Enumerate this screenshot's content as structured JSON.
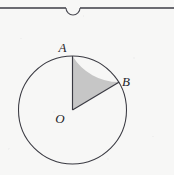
{
  "figure": {
    "background_color": "#f7f7f6",
    "stroke_color": "#3a3a42",
    "sector_fill_color": "#c6c6c6",
    "labels": {
      "center": "O",
      "top_point": "A",
      "arc_point": "B"
    },
    "geometry": {
      "center_x": 72.5,
      "center_y": 110,
      "radius": 54,
      "point_a_angle_deg": 90,
      "point_b_angle_deg": 30,
      "sector_sweep_deg": 60
    },
    "top_rule": {
      "name": "horizontal-rule-with-arc-notch",
      "y": 8,
      "x_start": 0,
      "x_end": 174,
      "notch_center_x": 73,
      "notch_radius": 7
    }
  },
  "artifacts": {
    "ghost_marks": [
      {
        "text": "",
        "x": 8,
        "y": 16
      },
      {
        "text": "",
        "x": 96,
        "y": 14
      },
      {
        "text": "",
        "x": 40,
        "y": 168
      }
    ]
  }
}
